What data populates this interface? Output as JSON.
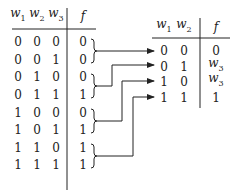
{
  "left_table": {
    "headers": [
      {
        "var": "w",
        "sub": "1"
      },
      {
        "var": "w",
        "sub": "2"
      },
      {
        "var": "w",
        "sub": "3"
      },
      {
        "var": "f",
        "sub": ""
      }
    ],
    "rows": [
      [
        "0",
        "0",
        "0",
        "0"
      ],
      [
        "0",
        "0",
        "1",
        "0"
      ],
      [
        "0",
        "1",
        "0",
        "0"
      ],
      [
        "0",
        "1",
        "1",
        "1"
      ],
      [
        "1",
        "0",
        "0",
        "0"
      ],
      [
        "1",
        "0",
        "1",
        "1"
      ],
      [
        "1",
        "1",
        "0",
        "1"
      ],
      [
        "1",
        "1",
        "1",
        "1"
      ]
    ]
  },
  "right_table": {
    "headers": [
      {
        "var": "w",
        "sub": "1"
      },
      {
        "var": "w",
        "sub": "2"
      },
      {
        "var": "f",
        "sub": ""
      }
    ],
    "rows": [
      {
        "w1": "0",
        "w2": "0",
        "f_var": "0",
        "f_sub": ""
      },
      {
        "w1": "0",
        "w2": "1",
        "f_var": "w",
        "f_sub": "3"
      },
      {
        "w1": "1",
        "w2": "0",
        "f_var": "w",
        "f_sub": "3"
      },
      {
        "w1": "1",
        "w2": "1",
        "f_var": "1",
        "f_sub": ""
      }
    ]
  },
  "colors": {
    "ink": "#222222",
    "background": "#ffffff"
  }
}
